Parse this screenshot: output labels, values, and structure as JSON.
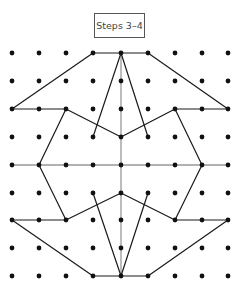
{
  "label": "Steps 3–4",
  "grid": {
    "cols_x": [
      12,
      39,
      66,
      93,
      121,
      148,
      175,
      202,
      228
    ],
    "rows_y": [
      53,
      81,
      109,
      137,
      165,
      193,
      220,
      248,
      276
    ],
    "dot_color": "#111111"
  },
  "axes": {
    "color": "#999999",
    "vertical": [
      [
        4,
        0
      ],
      [
        4,
        8
      ]
    ],
    "horizontal": [
      [
        0,
        4
      ],
      [
        8,
        4
      ]
    ]
  },
  "segments_color": "#1a1a1a",
  "segments": [
    [
      [
        3,
        0
      ],
      [
        4,
        0
      ]
    ],
    [
      [
        4,
        0
      ],
      [
        5,
        0
      ]
    ],
    [
      [
        3,
        0
      ],
      [
        0,
        2
      ]
    ],
    [
      [
        5,
        0
      ],
      [
        8,
        2
      ]
    ],
    [
      [
        4,
        0
      ],
      [
        3,
        3
      ]
    ],
    [
      [
        4,
        0
      ],
      [
        5,
        3
      ]
    ],
    [
      [
        0,
        2
      ],
      [
        2,
        2
      ]
    ],
    [
      [
        6,
        2
      ],
      [
        8,
        2
      ]
    ],
    [
      [
        2,
        2
      ],
      [
        4,
        3
      ]
    ],
    [
      [
        4,
        3
      ],
      [
        6,
        2
      ]
    ],
    [
      [
        2,
        2
      ],
      [
        1,
        4
      ]
    ],
    [
      [
        6,
        2
      ],
      [
        7,
        4
      ]
    ],
    [
      [
        1,
        4
      ],
      [
        2,
        6
      ]
    ],
    [
      [
        7,
        4
      ],
      [
        6,
        6
      ]
    ],
    [
      [
        2,
        6
      ],
      [
        4,
        5
      ]
    ],
    [
      [
        4,
        5
      ],
      [
        6,
        6
      ]
    ],
    [
      [
        0,
        6
      ],
      [
        2,
        6
      ]
    ],
    [
      [
        6,
        6
      ],
      [
        8,
        6
      ]
    ],
    [
      [
        0,
        6
      ],
      [
        3,
        8
      ]
    ],
    [
      [
        8,
        6
      ],
      [
        5,
        8
      ]
    ],
    [
      [
        3,
        8
      ],
      [
        4,
        8
      ]
    ],
    [
      [
        4,
        8
      ],
      [
        5,
        8
      ]
    ],
    [
      [
        3,
        5
      ],
      [
        4,
        8
      ]
    ],
    [
      [
        5,
        5
      ],
      [
        4,
        8
      ]
    ]
  ]
}
